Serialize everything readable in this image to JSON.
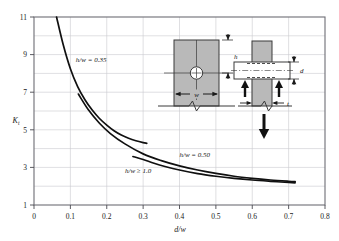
{
  "chart_data": {
    "type": "line",
    "title": "",
    "xlabel": "d/w",
    "ylabel": "Kt",
    "xlim": [
      0,
      0.8
    ],
    "ylim": [
      1,
      11
    ],
    "grid": true,
    "legend_position": "inline-annotations",
    "xticks": [
      "0",
      "0.1",
      "0.2",
      "0.3",
      "0.4",
      "0.5",
      "0.6",
      "0.7",
      "0.8"
    ],
    "xtick_values": [
      0,
      0.1,
      0.2,
      0.3,
      0.4,
      0.5,
      0.6,
      0.7,
      0.8
    ],
    "yticks": [
      "1",
      "3",
      "5",
      "7",
      "9",
      "11"
    ],
    "ytick_values": [
      1,
      3,
      5,
      7,
      9,
      11
    ],
    "series": [
      {
        "name": "h/w = 0.35",
        "label": "h/w = 0.35",
        "x": [
          0.062,
          0.08,
          0.1,
          0.12,
          0.14,
          0.16,
          0.18,
          0.2,
          0.22,
          0.24,
          0.26,
          0.28,
          0.3,
          0.31
        ],
        "y": [
          11.0,
          9.55,
          8.25,
          7.3,
          6.6,
          6.05,
          5.6,
          5.25,
          4.95,
          4.72,
          4.55,
          4.42,
          4.32,
          4.28
        ]
      },
      {
        "name": "h/w = 0.50",
        "label": "h/w = 0.50",
        "x": [
          0.122,
          0.15,
          0.18,
          0.21,
          0.25,
          0.3,
          0.35,
          0.4,
          0.45,
          0.5,
          0.55,
          0.6,
          0.65,
          0.7,
          0.718
        ],
        "y": [
          6.9,
          6.05,
          5.35,
          4.8,
          4.25,
          3.72,
          3.36,
          3.08,
          2.86,
          2.68,
          2.53,
          2.42,
          2.33,
          2.26,
          2.24
        ]
      },
      {
        "name": "h/w >= 1.0",
        "label": "h/w ≥ 1.0",
        "x": [
          0.272,
          0.3,
          0.33,
          0.36,
          0.4,
          0.45,
          0.5,
          0.55,
          0.6,
          0.65,
          0.7,
          0.718
        ],
        "y": [
          3.58,
          3.42,
          3.22,
          3.05,
          2.86,
          2.67,
          2.53,
          2.42,
          2.33,
          2.26,
          2.2,
          2.18
        ]
      }
    ],
    "annotations": [
      {
        "name": "label-hw-035",
        "text": "h/w = 0.35",
        "x": 0.115,
        "y": 8.6
      },
      {
        "name": "label-hw-050",
        "text": "h/w = 0.50",
        "x": 0.4,
        "y": 3.55
      },
      {
        "name": "label-hw-10",
        "text": "h/w ≥ 1.0",
        "x": 0.25,
        "y": 2.72
      }
    ]
  },
  "insets": {
    "front_view": {
      "name": "plate-with-hole-front-view",
      "dim_h": "h",
      "dim_w": "w"
    },
    "side_view": {
      "name": "pin-loaded-plate-side-view",
      "dim_d": "d",
      "dim_t": "t"
    }
  },
  "style": {
    "curve_color": "#101010",
    "grid_color": "#c9c9cf",
    "frame_color": "#6d6d75",
    "plate_fill": "#b9b9b9",
    "plate_stroke": "#3a3a3a",
    "background": "#ffffff"
  }
}
